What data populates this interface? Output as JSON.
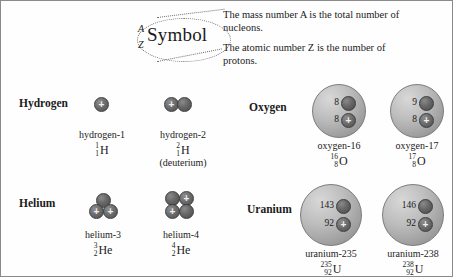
{
  "symbol_key": {
    "mass_number_letter": "A",
    "atomic_number_letter": "Z",
    "symbol_word": "Symbol",
    "callout_mass": "The mass number A is the total number of nucleons.",
    "callout_atomic": "The atomic number Z is the number of protons."
  },
  "elements": [
    {
      "name": "Hydrogen"
    },
    {
      "name": "Helium"
    },
    {
      "name": "Oxygen"
    },
    {
      "name": "Uranium"
    }
  ],
  "isotopes": [
    {
      "element": "Hydrogen",
      "name": "hydrogen-1",
      "mass_number": "1",
      "atomic_number": "1",
      "symbol": "H",
      "note": "",
      "protons": 1,
      "neutrons": 0,
      "style": "discrete"
    },
    {
      "element": "Hydrogen",
      "name": "hydrogen-2",
      "mass_number": "2",
      "atomic_number": "1",
      "symbol": "H",
      "note": "(deuterium)",
      "protons": 1,
      "neutrons": 1,
      "style": "discrete"
    },
    {
      "element": "Helium",
      "name": "helium-3",
      "mass_number": "3",
      "atomic_number": "2",
      "symbol": "He",
      "note": "",
      "protons": 2,
      "neutrons": 1,
      "style": "discrete"
    },
    {
      "element": "Helium",
      "name": "helium-4",
      "mass_number": "4",
      "atomic_number": "2",
      "symbol": "He",
      "note": "",
      "protons": 2,
      "neutrons": 2,
      "style": "discrete"
    },
    {
      "element": "Oxygen",
      "name": "oxygen-16",
      "mass_number": "16",
      "atomic_number": "8",
      "symbol": "O",
      "note": "",
      "protons": 8,
      "neutrons": 8,
      "neutron_count_label": "8",
      "proton_count_label": "8",
      "style": "sphere"
    },
    {
      "element": "Oxygen",
      "name": "oxygen-17",
      "mass_number": "17",
      "atomic_number": "8",
      "symbol": "O",
      "note": "",
      "protons": 8,
      "neutrons": 9,
      "neutron_count_label": "9",
      "proton_count_label": "8",
      "style": "sphere"
    },
    {
      "element": "Uranium",
      "name": "uranium-235",
      "mass_number": "235",
      "atomic_number": "92",
      "symbol": "U",
      "note": "",
      "protons": 92,
      "neutrons": 143,
      "neutron_count_label": "143",
      "proton_count_label": "92",
      "style": "sphere"
    },
    {
      "element": "Uranium",
      "name": "uranium-238",
      "mass_number": "238",
      "atomic_number": "92",
      "symbol": "U",
      "note": "",
      "protons": 92,
      "neutrons": 146,
      "neutron_count_label": "146",
      "proton_count_label": "92",
      "style": "sphere"
    }
  ],
  "legend": {
    "proton_glyph": "+",
    "neutron_glyph": ""
  },
  "colors": {
    "border": "#8a8a8a",
    "proton": "#6d6d6d",
    "neutron": "#676767",
    "sphere": "#bdbdbd",
    "text": "#1b1b1b",
    "leader": "#6f6f6f"
  }
}
